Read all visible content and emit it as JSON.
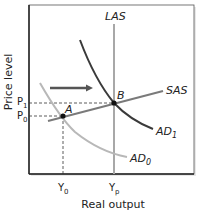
{
  "diagram": {
    "type": "economics-ad-as",
    "axes": {
      "xlabel": "Real output",
      "ylabel": "Price level"
    },
    "curves": {
      "las": {
        "label": "LAS",
        "color": "#a8a8a8"
      },
      "sas": {
        "label": "SAS",
        "color": "#7a7a7a"
      },
      "ad0": {
        "label": "AD",
        "sub": "0",
        "color": "#b8b8b8"
      },
      "ad1": {
        "label": "AD",
        "sub": "1",
        "color": "#3a3a3a"
      }
    },
    "points": {
      "a": {
        "label": "A"
      },
      "b": {
        "label": "B"
      }
    },
    "ticks": {
      "p1": {
        "label": "P",
        "sub": "1"
      },
      "p0": {
        "label": "P",
        "sub": "0"
      },
      "y0": {
        "label": "Y",
        "sub": "0"
      },
      "yp": {
        "label": "Y",
        "sub": "p"
      }
    },
    "shift_arrow": {
      "direction": "right",
      "color": "#555555"
    }
  }
}
